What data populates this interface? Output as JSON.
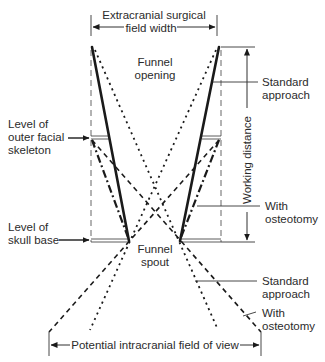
{
  "labels": {
    "extracranial_line1": "Extracranial surgical",
    "extracranial_line2": "field width",
    "funnel_opening_line1": "Funnel",
    "funnel_opening_line2": "opening",
    "standard_approach_top_line1": "Standard",
    "standard_approach_top_line2": "approach",
    "working_distance": "Working distance",
    "outer_facial_line1": "Level of",
    "outer_facial_line2": "outer facial",
    "outer_facial_line3": "skeleton",
    "with_osteotomy_top_line1": "With",
    "with_osteotomy_top_line2": "osteotomy",
    "skull_base_line1": "Level of",
    "skull_base_line2": "skull base",
    "funnel_spout_line1": "Funnel",
    "funnel_spout_line2": "spout",
    "standard_approach_bottom_line1": "Standard",
    "standard_approach_bottom_line2": "approach",
    "with_osteotomy_bottom_line1": "With",
    "with_osteotomy_bottom_line2": "osteotomy",
    "intracranial_field": "Potential intracranial field of view"
  },
  "colors": {
    "ink": "#1a1a1a",
    "text": "#2b2b2b",
    "guide": "#555555",
    "background": "#ffffff"
  }
}
